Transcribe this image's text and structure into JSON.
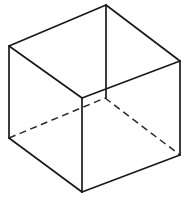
{
  "figure": {
    "type": "wireframe-cube",
    "canvas": {
      "width": 189,
      "height": 197,
      "background": "#ffffff"
    },
    "style": {
      "visible_edge_color": "#1a1a1a",
      "visible_edge_width": 1.7,
      "hidden_edge_color": "#2a2a2a",
      "hidden_edge_width": 1.5,
      "hidden_dash_pattern": "7 4.5",
      "face_fill": "#ffffff"
    },
    "vertices": {
      "top_back": {
        "label": "top-back-apex",
        "x": 106,
        "y": 5
      },
      "top_left": {
        "label": "top-left",
        "x": 9,
        "y": 46
      },
      "top_right": {
        "label": "top-right",
        "x": 180,
        "y": 61
      },
      "top_front": {
        "label": "top-front-center",
        "x": 82,
        "y": 98
      },
      "bottom_left": {
        "label": "bottom-left",
        "x": 9,
        "y": 138
      },
      "bottom_right": {
        "label": "bottom-right",
        "x": 180,
        "y": 155
      },
      "bottom_front": {
        "label": "bottom-front-center",
        "x": 82,
        "y": 192
      },
      "bottom_back_hidden": {
        "label": "bottom-back-hidden",
        "x": 106,
        "y": 98
      }
    },
    "faces": {
      "top": "106,5 180,61 82,98 9,46",
      "left": "9,46 82,98 82,192 9,138",
      "right": "82,98 180,61 180,155 82,192"
    },
    "edges_visible": [
      {
        "name": "top-back-to-top-left",
        "path": "M 106 5 L 9 46"
      },
      {
        "name": "top-back-to-top-right",
        "path": "M 106 5 L 180 61"
      },
      {
        "name": "top-left-to-top-front",
        "path": "M 9 46 L 82 98"
      },
      {
        "name": "top-right-to-top-front",
        "path": "M 180 61 L 82 98"
      },
      {
        "name": "vertical-back-edge",
        "path": "M 106 5 L 106 98"
      },
      {
        "name": "vertical-left-edge",
        "path": "M 9 46 L 9 138"
      },
      {
        "name": "vertical-right-edge",
        "path": "M 180 61 L 180 155"
      },
      {
        "name": "vertical-front-edge",
        "path": "M 82 98 L 82 192"
      },
      {
        "name": "bottom-left-to-bottom-front",
        "path": "M 9 138 L 82 192"
      },
      {
        "name": "bottom-right-to-bottom-front",
        "path": "M 180 155 L 82 192"
      }
    ],
    "edges_hidden": [
      {
        "name": "hidden-bottom-left-to-center",
        "path": "M 9 138 L 105 98"
      },
      {
        "name": "hidden-center-to-bottom-right",
        "path": "M 105 98 L 180 155"
      }
    ]
  }
}
